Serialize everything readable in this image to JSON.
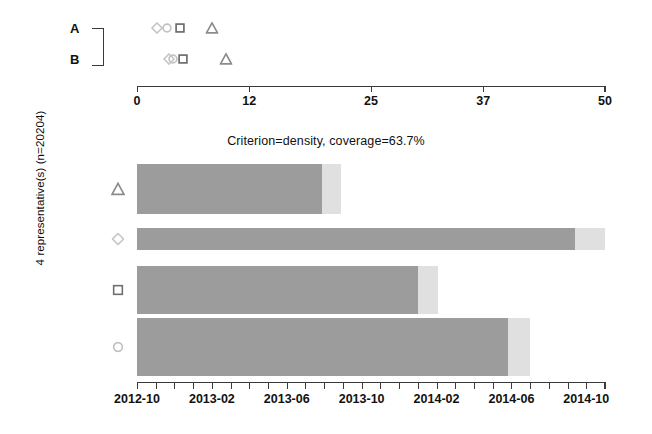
{
  "ylabel": "4 representative(s) (n=20204)",
  "main_title": "Criterion=density, coverage=63.7%",
  "groups": {
    "a_label": "A",
    "b_label": "B"
  },
  "colors": {
    "bar_main": "#9c9c9c",
    "bar_tail": "#e0e0e0",
    "axis": "#3a3a3a",
    "text": "#111111",
    "marker_triangle": "#8c8c8c",
    "marker_diamond": "#c8c8c8",
    "marker_square": "#6e6e6e",
    "marker_circle": "#c2c2c2"
  },
  "top_axis": {
    "min": 0,
    "max": 50,
    "ticks": [
      0,
      12,
      25,
      37,
      50
    ],
    "tick_labels": [
      "0",
      "12",
      "25",
      "37",
      "50"
    ]
  },
  "bottom_axis": {
    "tick_labels": [
      "2012-10",
      "2013-02",
      "2013-06",
      "2013-10",
      "2014-02",
      "2014-06",
      "2014-10"
    ],
    "n_minor_ticks": 25,
    "start": "2012-10",
    "end": "2014-10"
  },
  "chart_data": {
    "type": "bar",
    "title": "Criterion=density, coverage=63.7%",
    "xlabel": "",
    "ylabel": "4 representative(s) (n=20204)",
    "grid": false,
    "legend": false,
    "orientation": "horizontal",
    "categories": [
      "triangle",
      "diamond",
      "square",
      "circle"
    ],
    "category_markers": [
      "triangle",
      "diamond",
      "square",
      "circle"
    ],
    "x_axis": {
      "type": "date",
      "min": "2012-10",
      "max": "2014-10",
      "tick_labels": [
        "2012-10",
        "2013-02",
        "2013-06",
        "2013-10",
        "2014-02",
        "2014-06",
        "2014-10"
      ]
    },
    "series": [
      {
        "name": "covered",
        "color": "#9c9c9c",
        "values_fraction": [
          0.395,
          0.935,
          0.6,
          0.792
        ],
        "end_dates": [
          "2013-07",
          "2014-07",
          "2014-01",
          "2014-05"
        ]
      },
      {
        "name": "extension",
        "color": "#e0e0e0",
        "values_fraction": [
          0.435,
          1.0,
          0.643,
          0.839
        ],
        "end_dates": [
          "2013-08",
          "2014-10",
          "2014-02",
          "2014-06"
        ]
      }
    ],
    "top_panel": {
      "type": "scatter",
      "xlim": [
        0,
        50
      ],
      "xticks": [
        0,
        12,
        25,
        37,
        50
      ],
      "rows": [
        {
          "label": "A",
          "points": [
            {
              "marker": "diamond",
              "x": 2.1
            },
            {
              "marker": "circle",
              "x": 3.2
            },
            {
              "marker": "square",
              "x": 4.6
            },
            {
              "marker": "triangle",
              "x": 8.0
            }
          ]
        },
        {
          "label": "B",
          "points": [
            {
              "marker": "diamond",
              "x": 3.4
            },
            {
              "marker": "circle",
              "x": 3.8
            },
            {
              "marker": "square",
              "x": 4.9
            },
            {
              "marker": "triangle",
              "x": 9.5
            }
          ]
        }
      ]
    }
  }
}
